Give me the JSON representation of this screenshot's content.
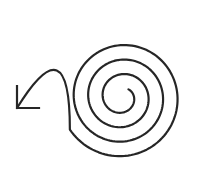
{
  "image": {
    "width": 212,
    "height": 176,
    "background": "#ffffff",
    "stroke_color": "#262626",
    "stroke_width": 2.2
  },
  "icon": {
    "name": "spiral-arrow",
    "description": "Clockwise spiral unwinding outward into a curved arrow pointing down-left",
    "spiral": {
      "center": [
        122,
        97
      ],
      "start_radius": 10,
      "growth_per_turn": 14.5,
      "start_angle_deg": -50,
      "turns": 3.55
    },
    "arrow_tail": {
      "control": [
        70,
        22
      ],
      "tip": [
        17,
        108
      ]
    },
    "arrowhead": {
      "vertical_leg": [
        [
          17,
          86
        ],
        [
          17,
          108
        ]
      ],
      "horizontal_leg": [
        [
          17,
          108
        ],
        [
          39,
          108
        ]
      ]
    }
  }
}
